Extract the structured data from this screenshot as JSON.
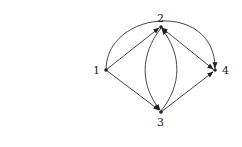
{
  "diagram": {
    "type": "directed-graph",
    "nodes": [
      {
        "id": "1",
        "label": "1",
        "x": 106,
        "y": 70
      },
      {
        "id": "2",
        "label": "2",
        "x": 161,
        "y": 27
      },
      {
        "id": "3",
        "label": "3",
        "x": 161,
        "y": 112
      },
      {
        "id": "4",
        "label": "4",
        "x": 215,
        "y": 70
      }
    ],
    "edges": [
      {
        "from": "1",
        "to": "2",
        "style": "straight"
      },
      {
        "from": "1",
        "to": "3",
        "style": "straight"
      },
      {
        "from": "1",
        "to": "4",
        "style": "arc-over-top"
      },
      {
        "from": "2",
        "to": "3",
        "style": "curve-left"
      },
      {
        "from": "3",
        "to": "2",
        "style": "curve-right"
      },
      {
        "from": "2",
        "to": "4",
        "style": "straight",
        "bidirectional": true
      },
      {
        "from": "3",
        "to": "4",
        "style": "straight"
      }
    ]
  }
}
